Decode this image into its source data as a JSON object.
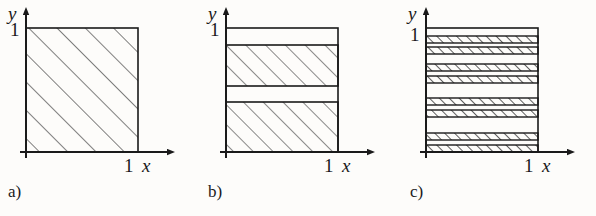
{
  "figure": {
    "kind": "math-diagram",
    "background_color": "#fdfcfa",
    "ink_color": "#1a1a1a",
    "hatch_color": "#3a3a3a",
    "hatch_angle_degrees": 45
  },
  "panels": [
    {
      "id": "a",
      "caption": "a)",
      "axes": {
        "y_label": "y",
        "x_label": "x",
        "y_tick_label": "1",
        "x_tick_label": "1"
      },
      "square": {
        "x0": 0.0,
        "x1": 1.0,
        "y0": 0.0,
        "y1": 1.0
      },
      "hatched_bands": [
        {
          "y_bottom": 0.0,
          "y_top": 1.0
        }
      ],
      "band_count": 1,
      "hatch_spacing_px": 20
    },
    {
      "id": "b",
      "caption": "b)",
      "axes": {
        "y_label": "y",
        "x_label": "x",
        "y_tick_label": "1",
        "x_tick_label": "1"
      },
      "square": {
        "x0": 0.0,
        "x1": 1.0,
        "y0": 0.0,
        "y1": 1.0
      },
      "hatched_bands": [
        {
          "y_bottom": 0.0,
          "y_top": 0.4
        },
        {
          "y_bottom": 0.53,
          "y_top": 0.86
        }
      ],
      "band_count": 2,
      "hatch_spacing_px": 14
    },
    {
      "id": "c",
      "caption": "c)",
      "axes": {
        "y_label": "y",
        "x_label": "x",
        "y_tick_label": "1",
        "x_tick_label": "1"
      },
      "square": {
        "x0": 0.0,
        "x1": 1.0,
        "y0": 0.0,
        "y1": 1.0
      },
      "hatched_bands": [
        {
          "y_bottom": 0.0,
          "y_top": 0.055
        },
        {
          "y_bottom": 0.1,
          "y_top": 0.155
        },
        {
          "y_bottom": 0.285,
          "y_top": 0.34
        },
        {
          "y_bottom": 0.385,
          "y_top": 0.44
        },
        {
          "y_bottom": 0.56,
          "y_top": 0.615
        },
        {
          "y_bottom": 0.66,
          "y_top": 0.715
        },
        {
          "y_bottom": 0.8,
          "y_top": 0.855
        },
        {
          "y_bottom": 0.89,
          "y_top": 0.945
        }
      ],
      "band_count": 8,
      "hatch_spacing_px": 7
    }
  ]
}
